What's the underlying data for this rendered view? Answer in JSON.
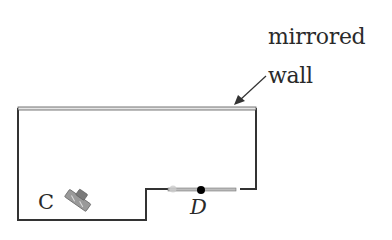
{
  "diagram": {
    "labels": {
      "mirrored_line1": "mirrored",
      "mirrored_line2": "wall",
      "camera_point": "C",
      "door_point": "D"
    },
    "colors": {
      "wall": "#333333",
      "mirror_outline": "#555555",
      "mirror_fill": "#e6e6e6",
      "door": "#888888",
      "door_dot": "#000000",
      "camera": "#8a8a8a"
    },
    "elements": {
      "room_outline": "floor plan outline with notch at bottom right",
      "mirrored_wall": "top wall, drawn as double line",
      "arrow": "pointer from label to mirrored wall",
      "camera": "camera icon at C",
      "door": "door segment with point D"
    }
  }
}
